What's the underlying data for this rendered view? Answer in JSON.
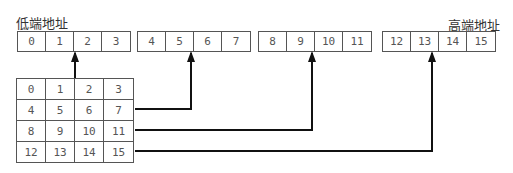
{
  "labels": {
    "low_address": "低端地址",
    "high_address": "高端地址"
  },
  "linear_groups": [
    [
      "0",
      "1",
      "2",
      "3"
    ],
    [
      "4",
      "5",
      "6",
      "7"
    ],
    [
      "8",
      "9",
      "10",
      "11"
    ],
    [
      "12",
      "13",
      "14",
      "15"
    ]
  ],
  "matrix": [
    [
      "0",
      "1",
      "2",
      "3"
    ],
    [
      "4",
      "5",
      "6",
      "7"
    ],
    [
      "8",
      "9",
      "10",
      "11"
    ],
    [
      "12",
      "13",
      "14",
      "15"
    ]
  ]
}
